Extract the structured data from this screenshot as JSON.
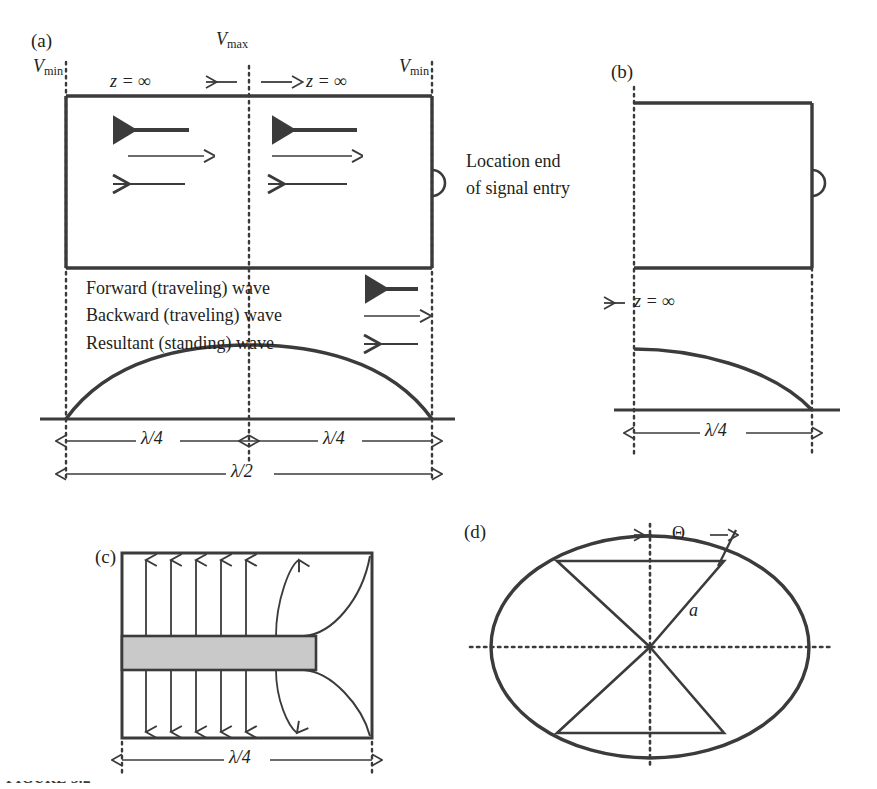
{
  "figure": {
    "panels": [
      {
        "id": "a",
        "tag": "(a)",
        "labels": {
          "v_min_left": {
            "v": "V",
            "sub": "min"
          },
          "v_max_center": {
            "v": "V",
            "sub": "max"
          },
          "v_min_right": {
            "v": "V",
            "sub": "min"
          },
          "z_infinity_left": "z = ∞",
          "z_infinity_right": "z = ∞",
          "location_note_line1": "Location end",
          "location_note_line2": "of signal entry"
        },
        "legend": [
          {
            "label": "Forward (traveling) wave",
            "arrow": "left-arrow-thick",
            "direction": "left",
            "weight": 4.2
          },
          {
            "label": "Backward (traveling) wave",
            "arrow": "right-arrow-thin",
            "direction": "right",
            "weight": 1.5
          },
          {
            "label": "Resultant (standing) wave",
            "arrow": "left-arrow-medium",
            "direction": "left",
            "weight": 2.2
          }
        ],
        "wave_arrows": [
          {
            "direction": "left",
            "weight": 4.2,
            "name": "forward-wave-arrow"
          },
          {
            "direction": "right",
            "weight": 1.5,
            "name": "backward-wave-arrow"
          },
          {
            "direction": "left",
            "weight": 2.2,
            "name": "resultant-wave-arrow"
          }
        ],
        "dimensions": [
          {
            "label": "λ/4",
            "span": "left-quarter"
          },
          {
            "label": "λ/4",
            "span": "right-quarter"
          },
          {
            "label": "λ/2",
            "span": "full-half"
          }
        ],
        "standing_wave": "half-sine-arc"
      },
      {
        "id": "b",
        "tag": "(b)",
        "labels": {
          "z_infinity": "z = ∞"
        },
        "dimensions": [
          {
            "label": "λ/4",
            "span": "quarter"
          }
        ],
        "standing_wave": "quarter-cosine-arc"
      },
      {
        "id": "c",
        "tag": "(c)",
        "dimensions": [
          {
            "label": "λ/4",
            "span": "quarter"
          }
        ],
        "field_arrow_count_up": 6,
        "field_arrow_count_down": 6,
        "conductor": "center-strip"
      },
      {
        "id": "d",
        "tag": "(d)",
        "labels": {
          "theta": "Θ",
          "radius": "a"
        }
      }
    ],
    "caption_fragment": "FIGURE 3.2"
  },
  "colors": {
    "ink": "#231f20",
    "line": "#3b3b3b",
    "conductor_fill": "#c9c9c9",
    "background": "#ffffff"
  }
}
